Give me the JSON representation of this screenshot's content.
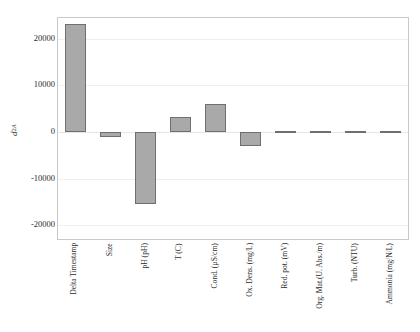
{
  "chart_data": {
    "type": "bar",
    "title": "",
    "subtitle": "",
    "xlabel": "",
    "ylabel": "d_A^2",
    "ylabel_parts": {
      "base": "d",
      "sup": "2",
      "sub": "A"
    },
    "categories": [
      "Delta Timestamp",
      "Size",
      "pH (pH)",
      "T (C)",
      "Cond. (µS/cm)",
      "Ox. Dens. (mg/L)",
      "Red. pot. (mV)",
      "Org. Mat.(U. Abs./m)",
      "Turb. (NTU)",
      "Ammonia (mg/N/L)"
    ],
    "values": [
      23200,
      -1100,
      -15500,
      3200,
      6000,
      -3100,
      250,
      250,
      180,
      150
    ],
    "ylim": [
      -23000,
      24500
    ],
    "yticks": [
      20000,
      10000,
      0,
      -10000,
      -20000
    ],
    "ytick_labels": [
      "20000",
      "10000",
      "0",
      "-10000",
      "-20000"
    ],
    "grid": true,
    "legend": "none",
    "bar_color": "#a9a9a9",
    "bar_edge_color": "#6f6f6f",
    "frame_color": "#c9c9c9",
    "grid_color": "#efefef",
    "background": "#ffffff"
  }
}
